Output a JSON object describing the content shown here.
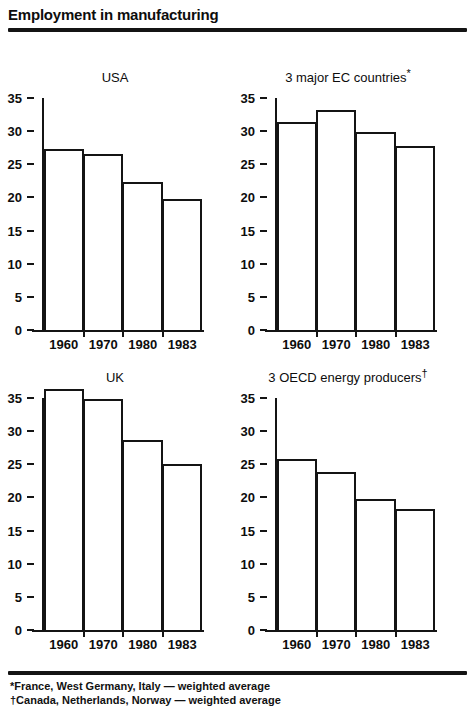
{
  "header": {
    "title": "Employment in manufacturing"
  },
  "footnotes": [
    "*France, West Germany, Italy — weighted average",
    "†Canada, Netherlands, Norway — weighted average"
  ],
  "chart_data": [
    {
      "id": "usa",
      "type": "bar",
      "title": "USA",
      "title_sup": "",
      "categories": [
        "1960",
        "1970",
        "1980",
        "1983"
      ],
      "values": [
        27.3,
        26.5,
        22.3,
        19.8
      ],
      "xlabel": "",
      "ylabel": "",
      "ylim": [
        0,
        35
      ],
      "yticks": [
        0,
        5,
        10,
        15,
        20,
        25,
        30,
        35
      ],
      "grid": false,
      "legend": "none"
    },
    {
      "id": "ec",
      "type": "bar",
      "title": "3 major EC countries",
      "title_sup": "*",
      "categories": [
        "1960",
        "1970",
        "1980",
        "1983"
      ],
      "values": [
        31.4,
        33.2,
        29.8,
        27.8
      ],
      "xlabel": "",
      "ylabel": "",
      "ylim": [
        0,
        35
      ],
      "yticks": [
        0,
        5,
        10,
        15,
        20,
        25,
        30,
        35
      ],
      "grid": false,
      "legend": "none"
    },
    {
      "id": "uk",
      "type": "bar",
      "title": "UK",
      "title_sup": "",
      "categories": [
        "1960",
        "1970",
        "1980",
        "1983"
      ],
      "values": [
        36.4,
        34.8,
        28.6,
        25.0
      ],
      "xlabel": "",
      "ylabel": "",
      "ylim": [
        0,
        35
      ],
      "yticks": [
        0,
        5,
        10,
        15,
        20,
        25,
        30,
        35
      ],
      "grid": false,
      "legend": "none"
    },
    {
      "id": "oecd",
      "type": "bar",
      "title": "3 OECD energy producers",
      "title_sup": "†",
      "categories": [
        "1960",
        "1970",
        "1980",
        "1983"
      ],
      "values": [
        25.8,
        23.9,
        19.7,
        18.2
      ],
      "xlabel": "",
      "ylabel": "",
      "ylim": [
        0,
        35
      ],
      "yticks": [
        0,
        5,
        10,
        15,
        20,
        25,
        30,
        35
      ],
      "grid": false,
      "legend": "none"
    }
  ],
  "colors": {
    "ink": "#141414",
    "paper": "#ffffff"
  }
}
